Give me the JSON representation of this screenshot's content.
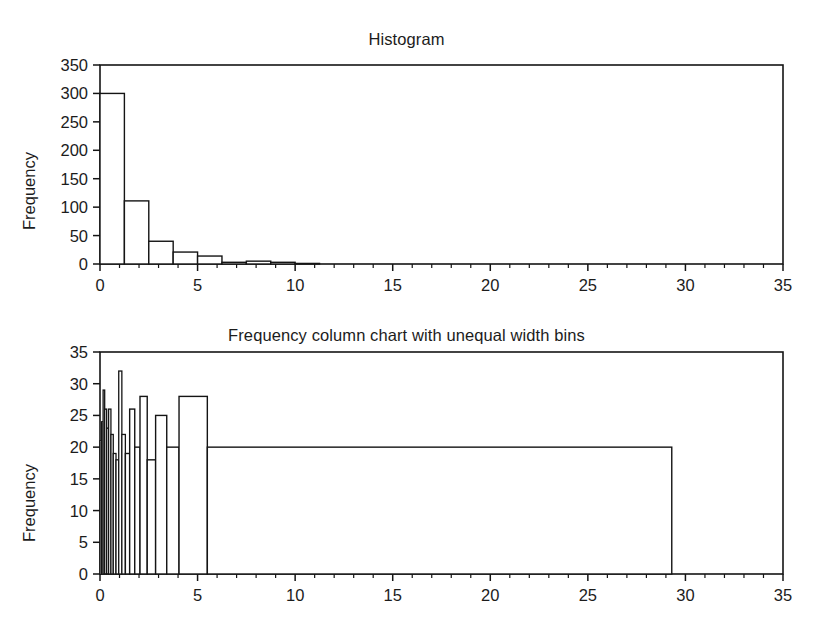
{
  "figure": {
    "background": "#ffffff",
    "ink_color": "#141414"
  },
  "charts": [
    {
      "id": "histogram",
      "title": "Histogram",
      "ylabel": "Frequency",
      "xlabel": "",
      "y_ticks": [
        "0",
        "50",
        "100",
        "150",
        "200",
        "250",
        "300",
        "350"
      ],
      "x_ticks": [
        "0",
        "5",
        "10",
        "15",
        "20",
        "25",
        "30",
        "35"
      ]
    },
    {
      "id": "unequal-width",
      "title": "Frequency column chart with unequal width bins",
      "ylabel": "Frequency",
      "xlabel": "",
      "y_ticks": [
        "0",
        "5",
        "10",
        "15",
        "20",
        "25",
        "30",
        "35"
      ],
      "x_ticks": [
        "0",
        "5",
        "10",
        "15",
        "20",
        "25",
        "30",
        "35"
      ]
    }
  ],
  "chart_data": [
    {
      "type": "bar",
      "id": "histogram",
      "title": "Histogram",
      "xlabel": "",
      "ylabel": "Frequency",
      "xlim": [
        0,
        35
      ],
      "ylim": [
        0,
        350
      ],
      "grid": false,
      "legend": null,
      "x_ticks": [
        0,
        5,
        10,
        15,
        20,
        25,
        30,
        35
      ],
      "x_minor_tick_step": 1,
      "y_ticks": [
        0,
        50,
        100,
        150,
        200,
        250,
        300,
        350
      ],
      "note": "Equal width bins of 1.25 units; strongly right-skewed.",
      "bins": [
        {
          "x0": 0.0,
          "x1": 1.25,
          "value": 300
        },
        {
          "x0": 1.25,
          "x1": 2.5,
          "value": 111
        },
        {
          "x0": 2.5,
          "x1": 3.75,
          "value": 40
        },
        {
          "x0": 3.75,
          "x1": 5.0,
          "value": 21
        },
        {
          "x0": 5.0,
          "x1": 6.25,
          "value": 14
        },
        {
          "x0": 6.25,
          "x1": 7.5,
          "value": 3
        },
        {
          "x0": 7.5,
          "x1": 8.75,
          "value": 5
        },
        {
          "x0": 8.75,
          "x1": 10.0,
          "value": 3
        },
        {
          "x0": 10.0,
          "x1": 11.25,
          "value": 1
        }
      ]
    },
    {
      "type": "bar",
      "id": "unequal-width",
      "title": "Frequency column chart with unequal width bins",
      "xlabel": "",
      "ylabel": "Frequency",
      "xlim": [
        0,
        35
      ],
      "ylim": [
        0,
        35
      ],
      "grid": false,
      "legend": null,
      "x_ticks": [
        0,
        5,
        10,
        15,
        20,
        25,
        30,
        35
      ],
      "x_minor_tick_step": 1,
      "y_ticks": [
        0,
        5,
        10,
        15,
        20,
        25,
        30,
        35
      ],
      "note": "Unequal width bins: many very narrow bins near zero, then progressively wider bins, ending with one very wide bin from 5.5 to 29.3 at frequency 20.",
      "bins": [
        {
          "x0": 0.0,
          "x1": 0.08,
          "value": 21
        },
        {
          "x0": 0.08,
          "x1": 0.16,
          "value": 24
        },
        {
          "x0": 0.16,
          "x1": 0.24,
          "value": 29
        },
        {
          "x0": 0.24,
          "x1": 0.34,
          "value": 26
        },
        {
          "x0": 0.34,
          "x1": 0.44,
          "value": 23
        },
        {
          "x0": 0.44,
          "x1": 0.56,
          "value": 26
        },
        {
          "x0": 0.56,
          "x1": 0.68,
          "value": 22
        },
        {
          "x0": 0.68,
          "x1": 0.82,
          "value": 19
        },
        {
          "x0": 0.82,
          "x1": 0.96,
          "value": 18
        },
        {
          "x0": 0.96,
          "x1": 1.12,
          "value": 32
        },
        {
          "x0": 1.12,
          "x1": 1.3,
          "value": 22
        },
        {
          "x0": 1.3,
          "x1": 1.52,
          "value": 19
        },
        {
          "x0": 1.52,
          "x1": 1.78,
          "value": 26
        },
        {
          "x0": 1.78,
          "x1": 2.05,
          "value": 20
        },
        {
          "x0": 2.05,
          "x1": 2.42,
          "value": 28
        },
        {
          "x0": 2.42,
          "x1": 2.85,
          "value": 18
        },
        {
          "x0": 2.85,
          "x1": 3.42,
          "value": 25
        },
        {
          "x0": 3.42,
          "x1": 4.05,
          "value": 20
        },
        {
          "x0": 4.05,
          "x1": 5.5,
          "value": 28
        },
        {
          "x0": 5.5,
          "x1": 29.3,
          "value": 20
        }
      ]
    }
  ]
}
